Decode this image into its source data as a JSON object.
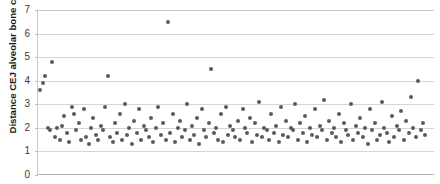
{
  "chart_data": {
    "type": "scatter",
    "title": "the cranial axis",
    "xlabel": "",
    "ylabel": "Distance CEJ alveolar bone crest",
    "ylim": [
      0,
      7
    ],
    "xlim": [
      0,
      165
    ],
    "yticks": [
      0,
      1,
      2,
      3,
      4,
      5,
      6,
      7
    ],
    "ytick_labels": [
      "0",
      "1",
      "2",
      "3",
      "4",
      "5",
      "6",
      "7"
    ],
    "xticks": [],
    "xtick_labels": [],
    "grid": true,
    "grid_axis": "y",
    "legend": null,
    "point_color": "#5b5b5b",
    "grid_color": "#d5d5d5",
    "axis_color": "#b4b4b4",
    "series": [
      {
        "name": "Distance CEJ alveolar bone crest",
        "x": [
          1,
          2,
          3,
          4,
          5,
          6,
          7,
          8,
          9,
          10,
          11,
          12,
          13,
          14,
          15,
          16,
          17,
          18,
          19,
          20,
          21,
          22,
          23,
          24,
          25,
          26,
          27,
          28,
          29,
          30,
          31,
          32,
          33,
          34,
          35,
          36,
          37,
          38,
          39,
          40,
          41,
          42,
          43,
          44,
          45,
          46,
          47,
          48,
          49,
          50,
          51,
          52,
          53,
          54,
          55,
          56,
          57,
          58,
          59,
          60,
          61,
          62,
          63,
          64,
          65,
          66,
          67,
          68,
          69,
          70,
          71,
          72,
          73,
          74,
          75,
          76,
          77,
          78,
          79,
          80,
          81,
          82,
          83,
          84,
          85,
          86,
          87,
          88,
          89,
          90,
          91,
          92,
          93,
          94,
          95,
          96,
          97,
          98,
          99,
          100,
          101,
          102,
          103,
          104,
          105,
          106,
          107,
          108,
          109,
          110,
          111,
          112,
          113,
          114,
          115,
          116,
          117,
          118,
          119,
          120,
          121,
          122,
          123,
          124,
          125,
          126,
          127,
          128,
          129,
          130,
          131,
          132,
          133,
          134,
          135,
          136,
          137,
          138,
          139,
          140,
          141,
          142,
          143,
          144,
          145,
          146,
          147,
          148,
          149,
          150,
          151,
          152,
          153,
          154,
          155,
          156,
          157,
          158,
          159,
          160,
          161
        ],
        "y": [
          3.6,
          3.9,
          4.2,
          2.0,
          1.9,
          4.8,
          1.6,
          2.0,
          1.5,
          2.1,
          2.5,
          1.8,
          1.4,
          2.9,
          2.6,
          1.9,
          2.2,
          1.5,
          2.8,
          1.6,
          1.3,
          2.0,
          2.4,
          1.7,
          1.5,
          2.1,
          1.9,
          2.9,
          4.2,
          1.6,
          1.4,
          2.2,
          1.8,
          2.6,
          1.5,
          3.0,
          1.7,
          2.0,
          1.3,
          2.3,
          1.8,
          2.8,
          1.5,
          2.1,
          1.9,
          1.6,
          2.4,
          1.4,
          2.0,
          2.9,
          1.7,
          2.2,
          1.5,
          6.5,
          1.8,
          2.6,
          1.4,
          2.0,
          2.3,
          1.6,
          1.9,
          3.0,
          1.5,
          2.1,
          1.7,
          2.4,
          1.3,
          2.8,
          1.9,
          1.6,
          2.2,
          4.5,
          1.8,
          2.0,
          1.5,
          2.6,
          1.4,
          2.9,
          1.7,
          2.1,
          1.9,
          1.6,
          2.3,
          1.5,
          2.8,
          2.0,
          1.8,
          2.4,
          1.4,
          2.2,
          1.7,
          3.1,
          1.6,
          2.0,
          1.9,
          1.5,
          2.6,
          1.8,
          2.1,
          1.4,
          2.9,
          1.7,
          2.3,
          1.6,
          2.0,
          1.9,
          3.0,
          1.5,
          2.2,
          1.8,
          2.5,
          1.4,
          2.0,
          1.7,
          2.8,
          1.6,
          2.1,
          1.9,
          3.2,
          1.5,
          2.3,
          1.8,
          2.0,
          1.6,
          2.6,
          1.4,
          2.2,
          1.9,
          1.7,
          3.0,
          1.5,
          2.1,
          1.8,
          2.4,
          1.6,
          2.0,
          1.3,
          2.8,
          1.9,
          2.2,
          1.5,
          1.7,
          3.1,
          2.0,
          1.8,
          1.4,
          2.5,
          1.6,
          2.1,
          1.9,
          2.7,
          1.5,
          2.3,
          1.8,
          3.3,
          2.0,
          1.6,
          4.0,
          1.9,
          2.2,
          1.7
        ]
      }
    ]
  }
}
